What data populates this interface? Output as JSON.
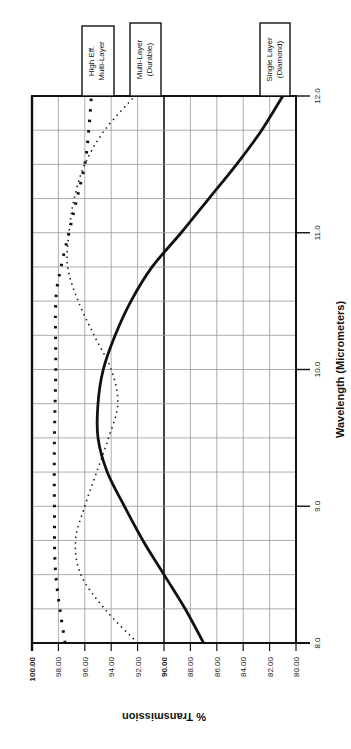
{
  "chart_data": {
    "type": "line",
    "orientation": "rotated-90-clockwise",
    "title": "",
    "xlabel": "Wavelength (Micrometers)",
    "ylabel": "% Transmission",
    "xlim": [
      8.0,
      12.0
    ],
    "ylim": [
      80.0,
      100.0
    ],
    "x_ticks": [
      "8.0",
      "9.0",
      "10.0",
      "11.0",
      "12.0"
    ],
    "y_ticks": [
      "100.00",
      "98.00",
      "96.00",
      "94.00",
      "92.00",
      "90.00",
      "88.00",
      "86.00",
      "84.00",
      "82.00",
      "80.00"
    ],
    "bold_y_ticks": [
      "100.00",
      "90.00"
    ],
    "grid": true,
    "legend_position": "top",
    "series": [
      {
        "name": "High Eff. Multi-Layer",
        "style": "dotted-heavy",
        "x": [
          8.0,
          8.5,
          9.0,
          9.5,
          10.0,
          10.5,
          10.75,
          11.0,
          11.25,
          11.5,
          11.75,
          12.0
        ],
        "values": [
          97.5,
          98.2,
          98.3,
          98.3,
          98.2,
          98.2,
          97.8,
          97.2,
          96.6,
          96.0,
          95.7,
          95.5
        ]
      },
      {
        "name": "Multi-Layer (Durable)",
        "style": "dotted-fine",
        "x": [
          8.0,
          8.25,
          8.5,
          8.75,
          9.0,
          9.25,
          9.5,
          9.75,
          10.0,
          10.25,
          10.5,
          10.75,
          11.0,
          11.25,
          11.5,
          11.75,
          12.0
        ],
        "values": [
          92.0,
          94.5,
          96.3,
          96.7,
          96.0,
          95.1,
          94.2,
          93.5,
          94.0,
          95.3,
          96.5,
          97.3,
          97.2,
          96.8,
          96.0,
          94.5,
          92.2
        ]
      },
      {
        "name": "Single Layer (Diamond)",
        "style": "solid-heavy",
        "x": [
          8.0,
          8.25,
          8.5,
          8.75,
          9.0,
          9.25,
          9.5,
          9.75,
          10.0,
          10.25,
          10.5,
          10.75,
          11.0,
          11.25,
          11.5,
          11.75,
          12.0
        ],
        "values": [
          87.0,
          88.4,
          90.0,
          91.6,
          93.0,
          94.3,
          95.0,
          95.0,
          94.6,
          93.7,
          92.5,
          90.9,
          88.7,
          86.6,
          84.5,
          82.6,
          81.0
        ]
      }
    ]
  }
}
